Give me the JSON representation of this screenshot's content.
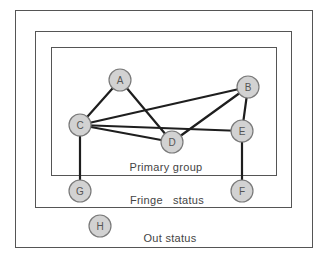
{
  "diagram": {
    "zones": [
      {
        "id": "out",
        "label": "Out status",
        "rect": [
          15,
          10,
          297,
          237
        ],
        "label_pos": [
          170,
          242
        ]
      },
      {
        "id": "fringe",
        "label": "Fringe   status",
        "rect": [
          35,
          31,
          256,
          176
        ],
        "label_pos": [
          167,
          204
        ]
      },
      {
        "id": "primary",
        "label": "Primary group",
        "rect": [
          51,
          47,
          225,
          128
        ],
        "label_pos": [
          166,
          171
        ]
      }
    ],
    "nodes": [
      {
        "id": "A",
        "label": "A",
        "x": 120,
        "y": 80,
        "zone": "primary"
      },
      {
        "id": "B",
        "label": "B",
        "x": 248,
        "y": 87,
        "zone": "primary"
      },
      {
        "id": "C",
        "label": "C",
        "x": 80,
        "y": 125,
        "zone": "primary"
      },
      {
        "id": "D",
        "label": "D",
        "x": 172,
        "y": 142,
        "zone": "primary"
      },
      {
        "id": "E",
        "label": "E",
        "x": 242,
        "y": 131,
        "zone": "primary"
      },
      {
        "id": "F",
        "label": "F",
        "x": 242,
        "y": 191,
        "zone": "fringe"
      },
      {
        "id": "G",
        "label": "G",
        "x": 80,
        "y": 191,
        "zone": "fringe"
      },
      {
        "id": "H",
        "label": "H",
        "x": 100,
        "y": 226,
        "zone": "out"
      }
    ],
    "edges": [
      [
        "A",
        "C"
      ],
      [
        "A",
        "D"
      ],
      [
        "C",
        "B"
      ],
      [
        "C",
        "E"
      ],
      [
        "C",
        "D"
      ],
      [
        "D",
        "B"
      ],
      [
        "B",
        "E"
      ],
      [
        "C",
        "G"
      ],
      [
        "E",
        "F"
      ]
    ],
    "node_radius": 11,
    "colors": {
      "node_fill": "#d2d2d2",
      "node_stroke": "#7a7a7a",
      "edge": "#1e1e1e",
      "box": "#555555",
      "text": "#444444"
    }
  }
}
